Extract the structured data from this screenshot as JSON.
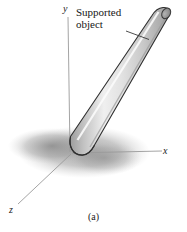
{
  "figure": {
    "caption": "(a)",
    "background_color": "#ffffff",
    "callout": {
      "line1": "Supported",
      "line2": "object",
      "leader_line": "leader-line"
    },
    "axes": {
      "y_label": "y",
      "x_label": "x",
      "z_label": "z",
      "line_color": "#9a9a9a"
    },
    "object": {
      "name": "cylindrical-rod",
      "body_color": "#d9d9d9",
      "highlight_color": "#f2f2f2",
      "shade_color": "#b0b0b0",
      "outline_color": "#3a3a3a",
      "end_cap_color": "#8e8e8e"
    },
    "shadow": {
      "name": "ground-shadow",
      "color": "#a9a9a9"
    }
  }
}
